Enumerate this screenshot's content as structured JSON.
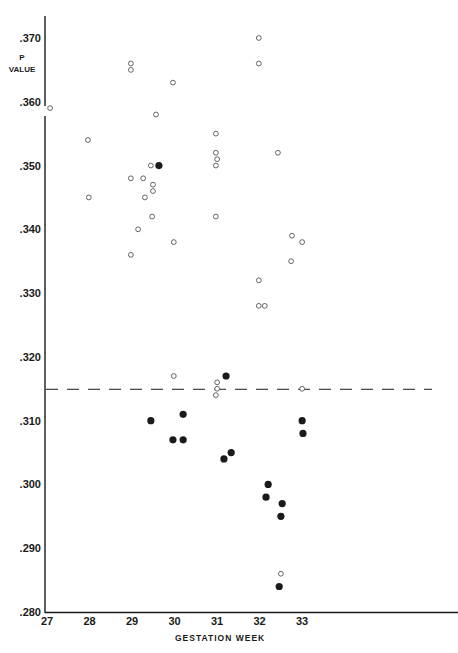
{
  "chart_data": {
    "type": "scatter",
    "title": "",
    "xlabel": "GESTATION WEEK",
    "ylabel_lines": [
      "P",
      "VALUE"
    ],
    "xlim": [
      27,
      33
    ],
    "ylim": [
      0.28,
      0.37
    ],
    "x_ticks": [
      "27",
      "28",
      "29",
      "30",
      "31",
      "32",
      "33"
    ],
    "y_ticks": [
      ".370",
      ".360",
      ".350",
      ".340",
      ".330",
      ".320",
      ".310",
      ".300",
      ".290",
      ".280"
    ],
    "y_tick_values": [
      0.37,
      0.36,
      0.35,
      0.34,
      0.33,
      0.32,
      0.31,
      0.3,
      0.29,
      0.28
    ],
    "grid": false,
    "legend": null,
    "reference_line": {
      "y": 0.315,
      "style": "dashed"
    },
    "series": [
      {
        "name": "open",
        "marker": "open-circle",
        "points": [
          [
            27.05,
            0.359
          ],
          [
            27.94,
            0.354
          ],
          [
            27.96,
            0.345
          ],
          [
            28.95,
            0.366
          ],
          [
            28.95,
            0.365
          ],
          [
            29.94,
            0.363
          ],
          [
            29.54,
            0.358
          ],
          [
            29.42,
            0.35
          ],
          [
            28.95,
            0.348
          ],
          [
            29.24,
            0.348
          ],
          [
            29.47,
            0.347
          ],
          [
            29.47,
            0.346
          ],
          [
            29.28,
            0.345
          ],
          [
            29.45,
            0.342
          ],
          [
            29.12,
            0.34
          ],
          [
            29.96,
            0.338
          ],
          [
            28.95,
            0.336
          ],
          [
            30.95,
            0.355
          ],
          [
            30.95,
            0.352
          ],
          [
            30.98,
            0.351
          ],
          [
            30.95,
            0.35
          ],
          [
            30.95,
            0.342
          ],
          [
            31.96,
            0.37
          ],
          [
            31.96,
            0.366
          ],
          [
            32.41,
            0.352
          ],
          [
            32.74,
            0.339
          ],
          [
            32.98,
            0.338
          ],
          [
            32.72,
            0.335
          ],
          [
            31.96,
            0.332
          ],
          [
            31.96,
            0.328
          ],
          [
            32.1,
            0.328
          ],
          [
            29.96,
            0.317
          ],
          [
            30.98,
            0.316
          ],
          [
            30.98,
            0.315
          ],
          [
            30.95,
            0.314
          ],
          [
            32.98,
            0.315
          ],
          [
            32.48,
            0.286
          ]
        ]
      },
      {
        "name": "filled",
        "marker": "filled-circle",
        "points": [
          [
            29.61,
            0.35
          ],
          [
            29.42,
            0.31
          ],
          [
            30.18,
            0.311
          ],
          [
            29.94,
            0.307
          ],
          [
            30.18,
            0.307
          ],
          [
            31.19,
            0.317
          ],
          [
            31.14,
            0.304
          ],
          [
            31.31,
            0.305
          ],
          [
            32.18,
            0.3
          ],
          [
            32.13,
            0.298
          ],
          [
            32.51,
            0.297
          ],
          [
            32.48,
            0.295
          ],
          [
            32.44,
            0.284
          ],
          [
            32.98,
            0.31
          ],
          [
            33.0,
            0.308
          ]
        ]
      }
    ]
  },
  "colors": {
    "ink": "#1a1a1a",
    "background": "#ffffff",
    "open_marker_stroke": "#555555"
  }
}
